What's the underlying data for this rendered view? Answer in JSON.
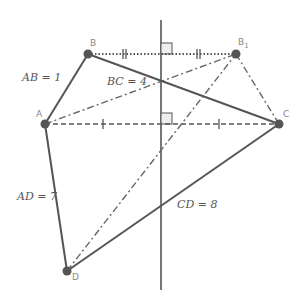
{
  "diagram": {
    "colors": {
      "line": "#555555",
      "point": "#555555",
      "label": "#888888",
      "text": "#555555"
    },
    "points": {
      "A": {
        "label": "A",
        "x": 45,
        "y": 124
      },
      "B": {
        "label": "B",
        "x": 88,
        "y": 54
      },
      "B1": {
        "label": "B",
        "sub": "1",
        "x": 236,
        "y": 54
      },
      "C": {
        "label": "C",
        "x": 279,
        "y": 124
      },
      "D": {
        "label": "D",
        "x": 67,
        "y": 271
      }
    },
    "axis_line": {
      "x": 161,
      "y1": 20,
      "y2": 290
    },
    "lengths": {
      "AB": "AB = 1",
      "BC": "BC = 4",
      "AD": "AD = 7",
      "CD": "CD = 8"
    },
    "segments": [
      {
        "from": "A",
        "to": "B",
        "style": "solid"
      },
      {
        "from": "B",
        "to": "C",
        "style": "solid"
      },
      {
        "from": "A",
        "to": "D",
        "style": "solid"
      },
      {
        "from": "D",
        "to": "C",
        "style": "solid"
      },
      {
        "from": "B",
        "to": "B1",
        "style": "dotted"
      },
      {
        "from": "A",
        "to": "C",
        "style": "dashed"
      },
      {
        "from": "A",
        "to": "B1",
        "style": "dash-dot"
      },
      {
        "from": "B1",
        "to": "C",
        "style": "dash-dot"
      },
      {
        "from": "D",
        "to": "B1",
        "style": "dash-dot"
      }
    ]
  }
}
